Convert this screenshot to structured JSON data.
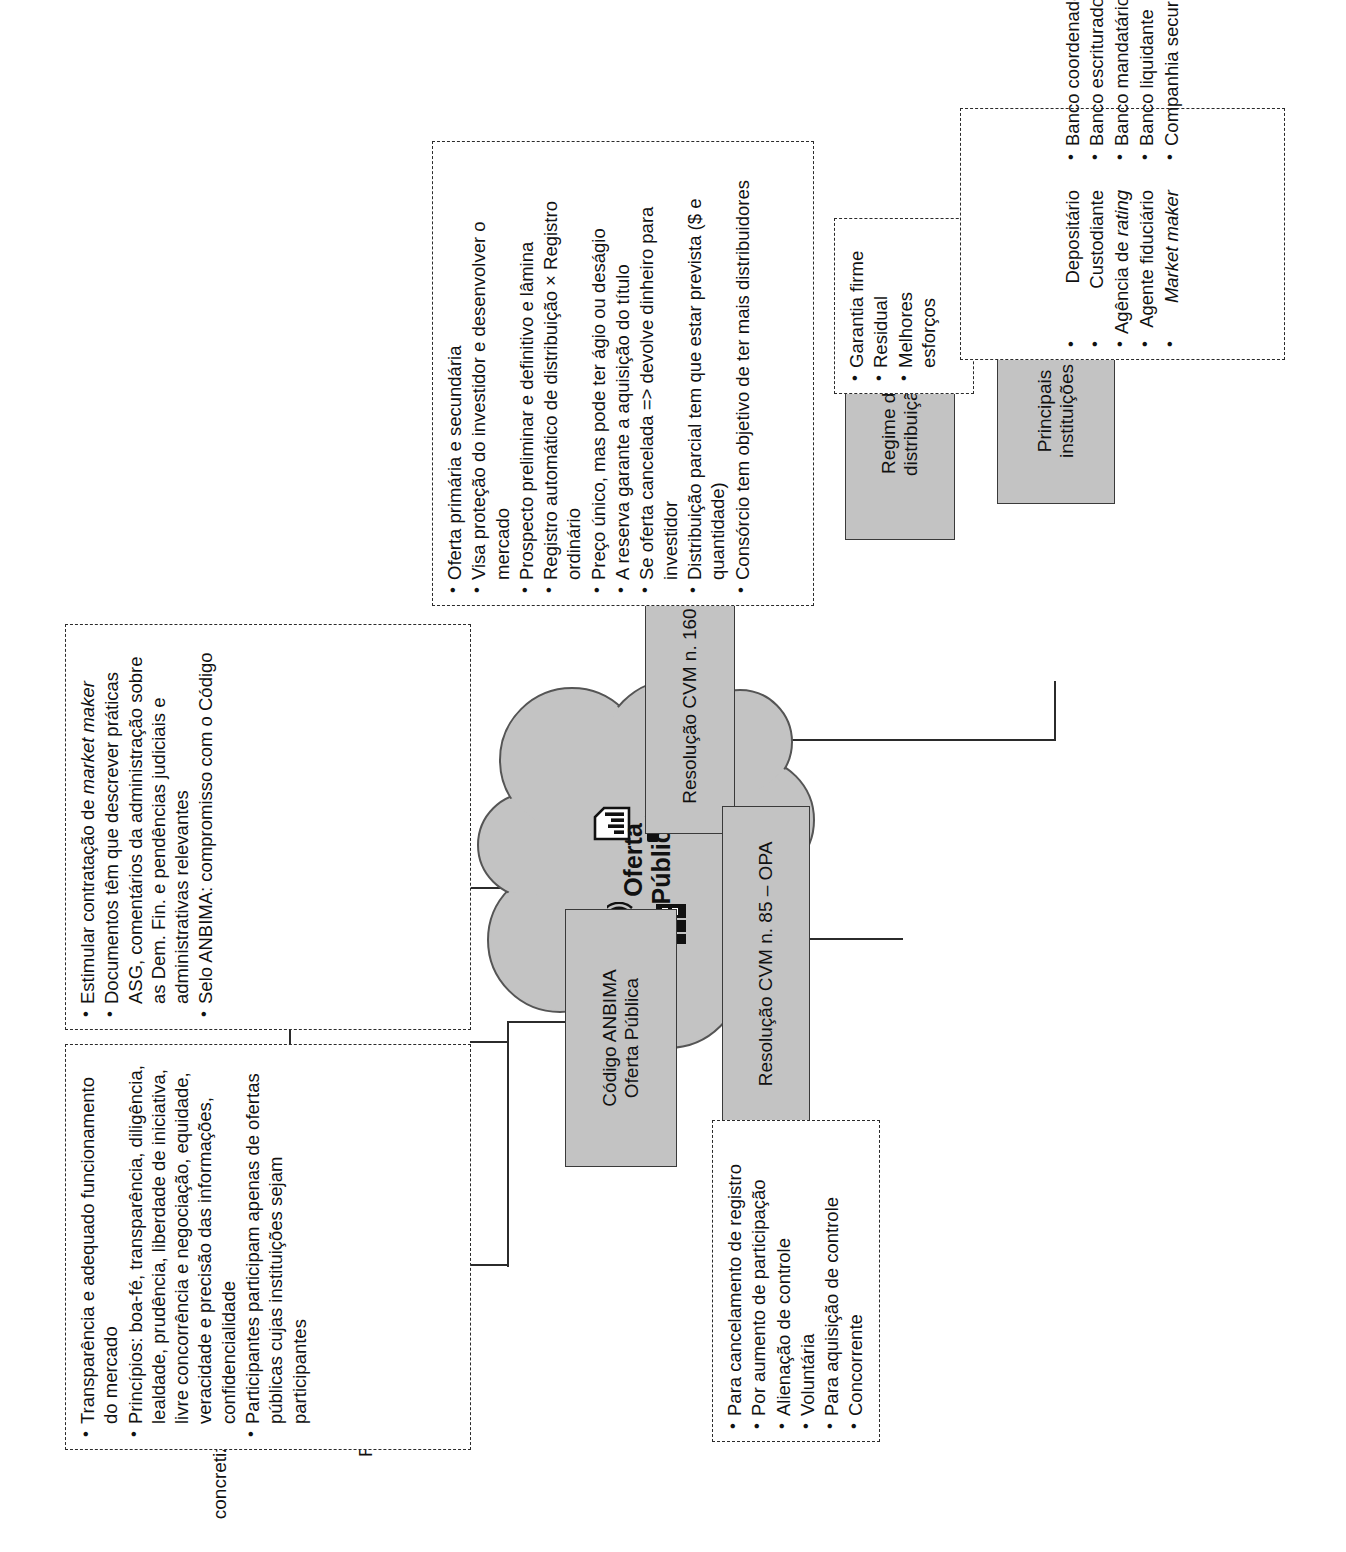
{
  "diagram": {
    "title": "Oferta Pública",
    "orientation": "rotated-90",
    "colors": {
      "node_fill": "#c3c3c3",
      "node_border": "#3a3a3a",
      "line": "#2b2b2b",
      "page": "#ffffff"
    }
  },
  "center": {
    "label_line1": "Oferta",
    "label_line2": "Pública",
    "icons": [
      "document-chart-icon",
      "gavel-icon",
      "megaphone-icon",
      "factory-icon"
    ]
  },
  "nodes": {
    "codigo_anbima": {
      "line1": "Código ANBIMA",
      "line2": "Oferta Pública"
    },
    "riscos": {
      "label": "Riscos"
    },
    "cvm160": {
      "label": "Resolução CVM n. 160"
    },
    "cvm85": {
      "label": "Resolução CVM n. 85 – OPA"
    },
    "regime": {
      "line1": "Regime de",
      "line2": "distribuição"
    },
    "instituicoes": {
      "line1": "Principais",
      "line2": "instituições"
    }
  },
  "riscos_children": {
    "rateio": "Rateio",
    "nao_concretizacao_l1": "Não",
    "nao_concretizacao_l2": "concretização"
  },
  "notes": {
    "anbima_principios": [
      "Transparência e adequado funcionamento do mercado",
      "Princípios: boa-fé, transparência, diligência, lealdade, prudência, liberdade de iniciativa, livre concorrência e negociação, equidade, veracidade e precisão das informações, confidencialidade",
      "Participantes participam apenas de ofertas públicas cujas instituições sejam participantes"
    ],
    "anbima_regras": [
      "Estimular contratação de <i>market maker</i>",
      "Documentos têm que descrever práticas ASG, comentários da administração sobre as Dem. Fin. e pendências judiciais e administrativas relevantes",
      "Selo ANBIMA: compromisso com o Código"
    ],
    "cvm160_list": [
      "Oferta primária e secundária",
      "Visa proteção do investidor e desenvolver o mercado",
      "Prospecto preliminar e definitivo e lâmina",
      "Registro automático de distribuição × Registro ordinário",
      "Preço único, mas pode ter ágio ou deságio",
      "A reserva garante a aquisição do título",
      "Se oferta cancelada =&gt; devolve dinheiro para investidor",
      "Distribuição parcial tem que estar prevista ($ e quantidade)",
      "Consórcio tem objetivo de ter mais distribuidores"
    ],
    "cvm85_list": [
      "Para cancelamento de registro",
      "Por aumento de participação",
      "Alienação de controle",
      "Voluntária",
      "Para aquisição de controle",
      "Concorrente"
    ],
    "regime_list": [
      "Garantia firme",
      "Residual",
      "Melhores esforços"
    ],
    "instituicoes_left": [
      "Depositário",
      "Custodiante",
      "Agência de <i>rating</i>",
      "Agente fiduciário",
      "<i>Market maker</i>"
    ],
    "instituicoes_right": [
      "Banco coordenador",
      "Banco escriturador",
      "Banco mandatário",
      "Banco liquidante",
      "Companhia securitizadora"
    ]
  }
}
